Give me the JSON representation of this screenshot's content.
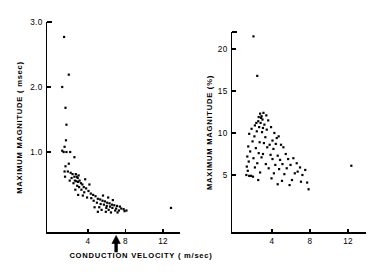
{
  "figure": {
    "background": "#ffffff",
    "ink": "#000000",
    "panel_count": 2,
    "shared_xlabel": "CONDUCTION  VELOCITY ( m/sec)"
  },
  "chart_data": [
    {
      "type": "scatter",
      "panel": "left",
      "title": "",
      "xlabel": "CONDUCTION  VELOCITY ( m/sec)",
      "ylabel": "MAXIMUM  MAGNITUDE  ( msec)",
      "xlim": [
        0.8,
        14.2
      ],
      "ylim": [
        0.0,
        3.15
      ],
      "xticks": [
        4,
        8,
        12
      ],
      "xticklabels": [
        "4",
        "8",
        "12"
      ],
      "yticks": [
        1.0,
        2.0,
        3.0
      ],
      "yticklabels": [
        "1.0",
        "2.0",
        "3.0"
      ],
      "grid": false,
      "legend": "none",
      "annotations": [
        {
          "kind": "arrow-up",
          "x": 7.0,
          "label": ""
        }
      ],
      "points": [
        [
          1.45,
          2.77
        ],
        [
          1.95,
          2.19
        ],
        [
          1.25,
          2.0
        ],
        [
          1.6,
          1.68
        ],
        [
          1.7,
          1.42
        ],
        [
          1.65,
          1.18
        ],
        [
          1.5,
          1.08
        ],
        [
          1.25,
          1.02
        ],
        [
          1.4,
          1.0
        ],
        [
          1.7,
          1.0
        ],
        [
          2.1,
          1.0
        ],
        [
          2.55,
          0.92
        ],
        [
          1.95,
          0.82
        ],
        [
          1.6,
          0.78
        ],
        [
          1.5,
          0.7
        ],
        [
          1.85,
          0.7
        ],
        [
          2.15,
          0.68
        ],
        [
          2.35,
          0.66
        ],
        [
          1.55,
          0.62
        ],
        [
          2.55,
          0.62
        ],
        [
          2.7,
          0.66
        ],
        [
          2.8,
          0.62
        ],
        [
          2.9,
          0.6
        ],
        [
          3.0,
          0.64
        ],
        [
          2.6,
          0.56
        ],
        [
          2.75,
          0.55
        ],
        [
          2.95,
          0.54
        ],
        [
          3.1,
          0.56
        ],
        [
          2.45,
          0.52
        ],
        [
          3.25,
          0.52
        ],
        [
          3.4,
          0.5
        ],
        [
          2.85,
          0.48
        ],
        [
          3.05,
          0.46
        ],
        [
          3.55,
          0.46
        ],
        [
          3.8,
          0.44
        ],
        [
          2.65,
          0.42
        ],
        [
          3.3,
          0.42
        ],
        [
          4.05,
          0.4
        ],
        [
          3.6,
          0.38
        ],
        [
          4.3,
          0.36
        ],
        [
          2.95,
          0.34
        ],
        [
          3.45,
          0.33
        ],
        [
          4.55,
          0.34
        ],
        [
          4.8,
          0.32
        ],
        [
          3.9,
          0.3
        ],
        [
          4.35,
          0.29
        ],
        [
          5.05,
          0.28
        ],
        [
          5.3,
          0.27
        ],
        [
          4.6,
          0.25
        ],
        [
          5.55,
          0.25
        ],
        [
          5.8,
          0.24
        ],
        [
          4.95,
          0.22
        ],
        [
          6.05,
          0.22
        ],
        [
          5.35,
          0.2
        ],
        [
          6.3,
          0.21
        ],
        [
          5.7,
          0.19
        ],
        [
          6.55,
          0.19
        ],
        [
          6.8,
          0.18
        ],
        [
          6.0,
          0.17
        ],
        [
          7.1,
          0.17
        ],
        [
          6.35,
          0.16
        ],
        [
          7.4,
          0.16
        ],
        [
          4.7,
          0.15
        ],
        [
          5.2,
          0.15
        ],
        [
          5.95,
          0.14
        ],
        [
          6.6,
          0.14
        ],
        [
          7.0,
          0.13
        ],
        [
          7.55,
          0.13
        ],
        [
          7.8,
          0.12
        ],
        [
          5.45,
          0.11
        ],
        [
          6.2,
          0.11
        ],
        [
          6.9,
          0.1
        ],
        [
          7.3,
          0.1
        ],
        [
          7.9,
          0.09
        ],
        [
          8.1,
          0.1
        ],
        [
          5.05,
          0.08
        ],
        [
          5.9,
          0.08
        ],
        [
          6.45,
          0.07
        ],
        [
          7.15,
          0.07
        ],
        [
          12.85,
          0.14
        ],
        [
          5.6,
          0.33
        ],
        [
          6.15,
          0.3
        ],
        [
          6.65,
          0.26
        ],
        [
          4.15,
          0.5
        ],
        [
          3.7,
          0.58
        ],
        [
          2.25,
          0.6
        ],
        [
          2.05,
          0.56
        ]
      ]
    },
    {
      "type": "scatter",
      "panel": "right",
      "title": "",
      "xlabel": "CONDUCTION  VELOCITY ( m/sec)",
      "ylabel": "MAXIMUM  MAGNITUDE  (%)",
      "xlim": [
        0.8,
        14.2
      ],
      "ylim": [
        0.0,
        23.5
      ],
      "xticks": [
        4,
        8,
        12
      ],
      "xticklabels": [
        "4",
        "8",
        "12"
      ],
      "yticks": [
        5,
        10,
        15,
        20
      ],
      "yticklabels": [
        "5",
        "10",
        "15",
        "20"
      ],
      "grid": false,
      "legend": "none",
      "annotations": [],
      "points": [
        [
          2.05,
          21.5
        ],
        [
          2.45,
          16.8
        ],
        [
          2.75,
          12.3
        ],
        [
          3.1,
          12.4
        ],
        [
          2.6,
          11.9
        ],
        [
          2.85,
          11.8
        ],
        [
          3.0,
          11.6
        ],
        [
          2.55,
          11.4
        ],
        [
          2.35,
          11.2
        ],
        [
          2.8,
          11.2
        ],
        [
          3.2,
          11.0
        ],
        [
          3.6,
          11.5
        ],
        [
          2.2,
          10.9
        ],
        [
          2.65,
          10.7
        ],
        [
          3.05,
          10.6
        ],
        [
          3.45,
          10.4
        ],
        [
          1.85,
          10.5
        ],
        [
          2.4,
          10.2
        ],
        [
          2.95,
          10.1
        ],
        [
          3.9,
          10.7
        ],
        [
          4.25,
          10.0
        ],
        [
          1.6,
          9.9
        ],
        [
          2.15,
          9.6
        ],
        [
          3.3,
          9.5
        ],
        [
          4.5,
          9.4
        ],
        [
          4.7,
          9.6
        ],
        [
          1.95,
          9.0
        ],
        [
          2.7,
          8.9
        ],
        [
          3.15,
          8.8
        ],
        [
          3.75,
          8.6
        ],
        [
          4.4,
          8.7
        ],
        [
          4.95,
          8.6
        ],
        [
          1.5,
          8.4
        ],
        [
          2.3,
          8.2
        ],
        [
          3.5,
          8.3
        ],
        [
          4.15,
          8.1
        ],
        [
          5.2,
          8.3
        ],
        [
          1.7,
          7.8
        ],
        [
          2.6,
          7.6
        ],
        [
          3.05,
          7.5
        ],
        [
          3.85,
          7.4
        ],
        [
          4.6,
          7.3
        ],
        [
          5.45,
          7.5
        ],
        [
          1.4,
          7.2
        ],
        [
          2.05,
          7.0
        ],
        [
          2.9,
          7.1
        ],
        [
          4.05,
          6.9
        ],
        [
          4.85,
          6.8
        ],
        [
          5.7,
          6.9
        ],
        [
          6.25,
          7.0
        ],
        [
          1.55,
          6.6
        ],
        [
          2.45,
          6.4
        ],
        [
          3.35,
          6.3
        ],
        [
          4.35,
          6.2
        ],
        [
          5.1,
          6.3
        ],
        [
          5.95,
          6.2
        ],
        [
          6.6,
          6.4
        ],
        [
          1.35,
          6.0
        ],
        [
          2.2,
          5.9
        ],
        [
          3.65,
          5.8
        ],
        [
          4.75,
          5.7
        ],
        [
          5.55,
          5.8
        ],
        [
          6.95,
          5.9
        ],
        [
          7.5,
          5.6
        ],
        [
          1.45,
          5.5
        ],
        [
          2.75,
          5.3
        ],
        [
          4.2,
          5.2
        ],
        [
          5.3,
          5.1
        ],
        [
          6.4,
          5.2
        ],
        [
          7.2,
          5.0
        ],
        [
          1.3,
          5.0
        ],
        [
          1.6,
          4.9
        ],
        [
          1.8,
          4.9
        ],
        [
          2.0,
          4.8
        ],
        [
          2.55,
          4.4
        ],
        [
          3.95,
          4.6
        ],
        [
          5.05,
          4.3
        ],
        [
          6.1,
          4.4
        ],
        [
          7.05,
          4.2
        ],
        [
          7.7,
          4.1
        ],
        [
          4.6,
          3.9
        ],
        [
          5.85,
          3.8
        ],
        [
          7.85,
          3.3
        ],
        [
          12.35,
          6.1
        ],
        [
          3.4,
          12.1
        ],
        [
          2.9,
          12.0
        ],
        [
          4.05,
          9.1
        ],
        [
          6.7,
          5.4
        ]
      ]
    }
  ]
}
